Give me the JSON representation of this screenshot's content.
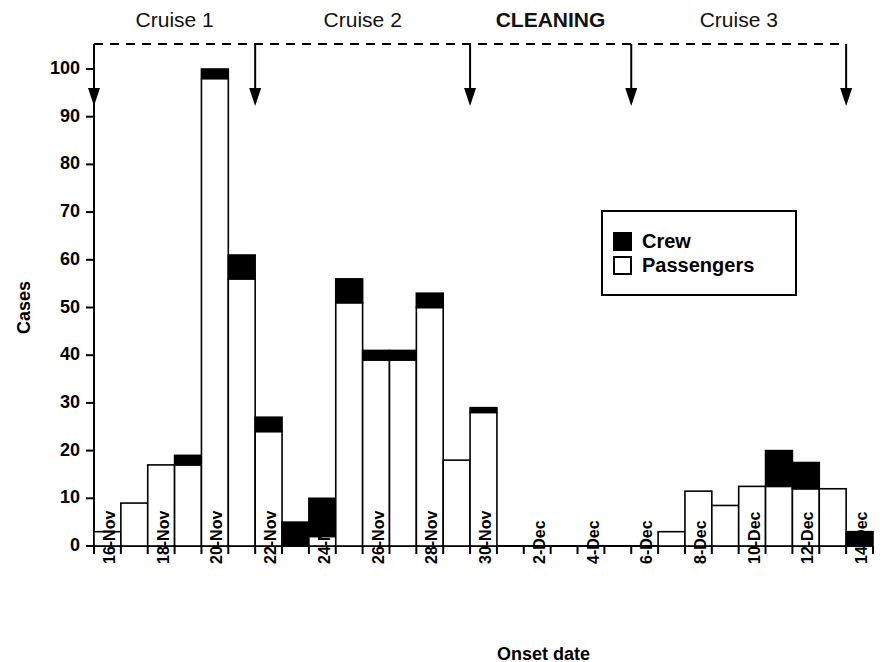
{
  "chart_data": {
    "type": "bar",
    "title": "",
    "xlabel": "Onset date",
    "ylabel": "Cases",
    "ylim": [
      0,
      100
    ],
    "ytick_step": 10,
    "yticks": [
      0,
      10,
      20,
      30,
      40,
      50,
      60,
      70,
      80,
      90,
      100
    ],
    "grid": false,
    "legend_position": "upper right",
    "stacked": true,
    "categories": [
      "16-Nov",
      "17-Nov",
      "18-Nov",
      "19-Nov",
      "20-Nov",
      "21-Nov",
      "22-Nov",
      "23-Nov",
      "24-Nov",
      "25-Nov",
      "26-Nov",
      "27-Nov",
      "28-Nov",
      "29-Nov",
      "30-Nov",
      "1-Dec",
      "2-Dec",
      "3-Dec",
      "4-Dec",
      "5-Dec",
      "6-Dec",
      "7-Dec",
      "8-Dec",
      "9-Dec",
      "10-Dec",
      "11-Dec",
      "12-Dec",
      "13-Dec",
      "14-Dec"
    ],
    "tick_labels": [
      "16-Nov",
      "",
      "18-Nov",
      "",
      "20-Nov",
      "",
      "22-Nov",
      "",
      "24-Nov",
      "",
      "26-Nov",
      "",
      "28-Nov",
      "",
      "30-Nov",
      "",
      "2-Dec",
      "",
      "4-Dec",
      "",
      "6-Dec",
      "",
      "8-Dec",
      "",
      "10-Dec",
      "",
      "12-Dec",
      "",
      "14-Dec"
    ],
    "series": [
      {
        "name": "Passengers",
        "color": "#ffffff",
        "values": [
          3,
          9,
          17,
          17,
          98,
          56,
          24,
          0,
          2,
          51,
          39,
          39,
          50,
          18,
          28,
          0,
          0,
          0,
          0,
          0,
          0,
          3,
          11.5,
          8.5,
          12.5,
          12.5,
          12,
          12,
          0
        ]
      },
      {
        "name": "Crew",
        "color": "#000000",
        "values": [
          0,
          0,
          0,
          2,
          2,
          5,
          3,
          5,
          8,
          5,
          2,
          2,
          3,
          0,
          1,
          0,
          0,
          0,
          0,
          0,
          0,
          0,
          0,
          0,
          0,
          7.5,
          5.5,
          0,
          3
        ]
      }
    ],
    "totals": [
      3,
      9,
      17,
      19,
      100,
      61,
      27,
      5,
      10,
      56,
      41,
      41,
      53,
      18,
      29,
      0,
      0,
      0,
      0,
      0,
      0,
      3,
      11.5,
      8.5,
      12.5,
      20,
      17.5,
      12,
      3
    ],
    "annotations": {
      "phases": [
        {
          "label": "Cruise 1",
          "bold": false
        },
        {
          "label": "Cruise 2",
          "bold": false
        },
        {
          "label": "CLEANING",
          "bold": true
        },
        {
          "label": "Cruise 3",
          "bold": false
        }
      ],
      "arrow_dates": [
        "16-Nov",
        "22-Nov",
        "30-Nov",
        "6-Dec",
        "14-Dec"
      ],
      "bracket_style": "dashed"
    },
    "legend": [
      {
        "label": "Crew",
        "swatch": "filled-black"
      },
      {
        "label": "Passengers",
        "swatch": "empty-white"
      }
    ]
  }
}
